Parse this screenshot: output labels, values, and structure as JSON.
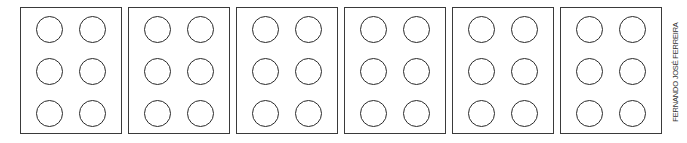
{
  "diagram": {
    "type": "braille-cell-grid",
    "cells": [
      {
        "index": 1,
        "dots": 6,
        "rows": 3,
        "cols": 2
      },
      {
        "index": 2,
        "dots": 6,
        "rows": 3,
        "cols": 2
      },
      {
        "index": 3,
        "dots": 6,
        "rows": 3,
        "cols": 2
      },
      {
        "index": 4,
        "dots": 6,
        "rows": 3,
        "cols": 2
      },
      {
        "index": 5,
        "dots": 6,
        "rows": 3,
        "cols": 2
      },
      {
        "index": 6,
        "dots": 6,
        "rows": 3,
        "cols": 2
      }
    ],
    "credit": "FERNANDO JOSÉ FERREIRA"
  }
}
